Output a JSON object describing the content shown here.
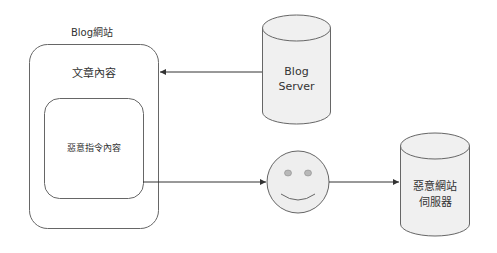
{
  "diagram": {
    "title_label": "Blog網站",
    "outer_box": {
      "label": "文章內容"
    },
    "inner_box": {
      "label": "惡意指令內容"
    },
    "blog_server": {
      "line1": "Blog",
      "line2": "Server"
    },
    "user": {
      "icon": "smiley-face-icon"
    },
    "malicious_server": {
      "line1": "惡意網站",
      "line2": "伺服器"
    },
    "edges": [
      {
        "from": "blog_server",
        "to": "outer_box"
      },
      {
        "from": "inner_box",
        "to": "user"
      },
      {
        "from": "user",
        "to": "malicious_server"
      }
    ],
    "colors": {
      "stroke": "#666666",
      "cylinder_fill": "#f0f0f0",
      "smiley_fill": "#eeeeee",
      "eye_fill": "#b8b8b8",
      "text": "#333333"
    }
  }
}
